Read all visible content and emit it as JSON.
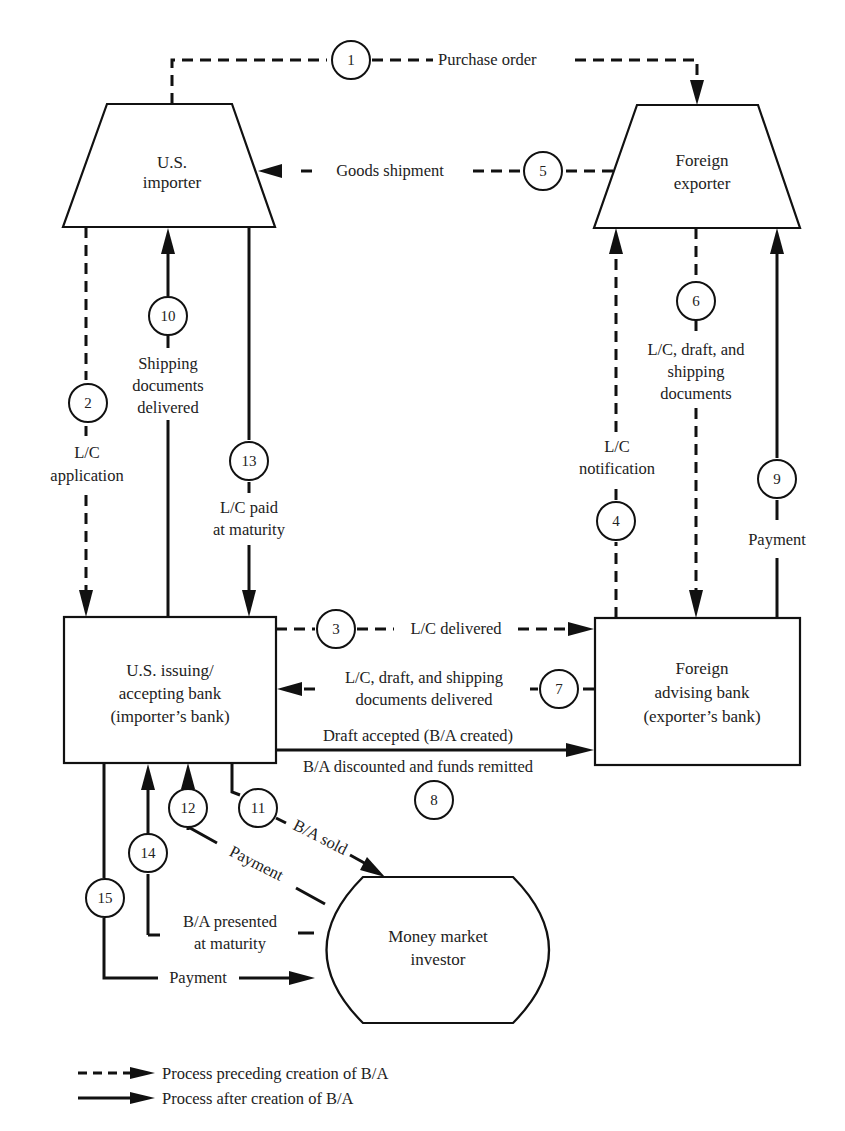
{
  "diagram": {
    "type": "banker's acceptance (B/A) flow diagram",
    "nodes": {
      "us_importer": {
        "line1": "U.S.",
        "line2": "importer"
      },
      "foreign_exporter": {
        "line1": "Foreign",
        "line2": "exporter"
      },
      "us_bank": {
        "line1": "U.S. issuing/",
        "line2": "accepting bank",
        "line3": "(importer’s bank)"
      },
      "foreign_bank": {
        "line1": "Foreign",
        "line2": "advising bank",
        "line3": "(exporter’s bank)"
      },
      "investor": {
        "line1": "Money market",
        "line2": "investor"
      }
    },
    "steps": [
      {
        "num": "1",
        "label": "Purchase order",
        "style": "dashed"
      },
      {
        "num": "2",
        "label_line1": "L/C",
        "label_line2": "application",
        "style": "dashed"
      },
      {
        "num": "3",
        "label": "L/C delivered",
        "style": "dashed"
      },
      {
        "num": "4",
        "label_line1": "L/C",
        "label_line2": "notification",
        "style": "dashed"
      },
      {
        "num": "5",
        "label": "Goods shipment",
        "style": "dashed"
      },
      {
        "num": "6",
        "label_line1": "L/C, draft, and",
        "label_line2": "shipping",
        "label_line3": "documents",
        "style": "dashed"
      },
      {
        "num": "7",
        "label_line1": "L/C, draft, and shipping",
        "label_line2": "documents delivered",
        "style": "dashed"
      },
      {
        "num": "8",
        "label_line1": "Draft accepted (B/A created)",
        "label_line2": "B/A discounted and funds remitted",
        "style": "solid"
      },
      {
        "num": "9",
        "label": "Payment",
        "style": "solid"
      },
      {
        "num": "10",
        "label_line1": "Shipping",
        "label_line2": "documents",
        "label_line3": "delivered",
        "style": "solid"
      },
      {
        "num": "11",
        "label": "B/A sold",
        "style": "solid"
      },
      {
        "num": "12",
        "label": "Payment",
        "style": "solid"
      },
      {
        "num": "13",
        "label_line1": "L/C paid",
        "label_line2": "at maturity",
        "style": "solid"
      },
      {
        "num": "14",
        "label_line1": "B/A presented",
        "label_line2": "at maturity",
        "style": "solid"
      },
      {
        "num": "15",
        "label": "Payment",
        "style": "solid"
      }
    ]
  },
  "legend": {
    "dashed": "Process preceding creation of B/A",
    "solid": "Process after creation of B/A"
  },
  "colors": {
    "ink": "#111111",
    "background": "#ffffff"
  }
}
